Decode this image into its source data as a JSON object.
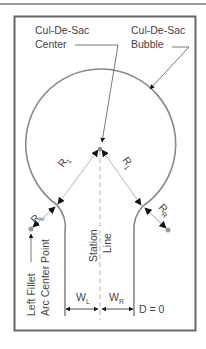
{
  "diagram": {
    "labels": {
      "center_line1": "Cul-De-Sac",
      "center_line2": "Center",
      "bubble_line1": "Cul-De-Sac",
      "bubble_line2": "Bubble",
      "r1_left": "R",
      "r1_left_sub": "1",
      "r1_right": "R",
      "r1_right_sub": "1",
      "rl": "R",
      "rl_sub": "L",
      "rr": "R",
      "rr_sub": "R",
      "station_line1": "Station",
      "station_line2": "Line",
      "left_fillet_line1": "Left Fillet",
      "left_fillet_line2": "Arc Center Point",
      "wl": "W",
      "wl_sub": "L",
      "wr": "W",
      "wr_sub": "R",
      "d_label": "D = 0"
    },
    "colors": {
      "outline": "#888888",
      "frame": "#666666",
      "leader": "#555555",
      "radius_line": "#c8c8c8",
      "arrow": "#111111",
      "text": "#444444"
    }
  }
}
